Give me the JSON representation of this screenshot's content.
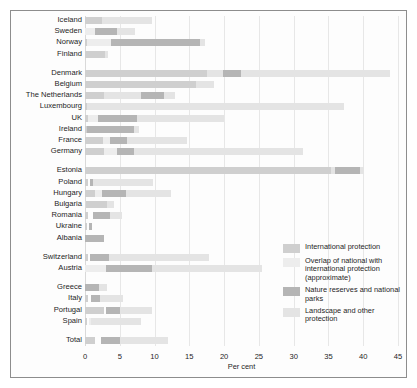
{
  "chart": {
    "type": "bar",
    "orientation": "horizontal",
    "stacked": true,
    "title": "",
    "xlabel": "Per cent",
    "ylabel": "",
    "xlim": [
      0,
      45
    ],
    "xticks": [
      0,
      5,
      10,
      15,
      20,
      25,
      30,
      35,
      40,
      45
    ],
    "grid": "vertical",
    "legend_position": "lower-right"
  },
  "chart_data": {
    "type": "bar",
    "orientation": "horizontal",
    "stacked": true,
    "title": "",
    "xlabel": "Per cent",
    "ylabel": "",
    "xlim": [
      0,
      45
    ],
    "xticks": [
      0,
      5,
      10,
      15,
      20,
      25,
      30,
      35,
      40,
      45
    ],
    "grid": "vertical",
    "legend_position": "lower-right",
    "series": [
      {
        "name": "International protection",
        "key": "intl",
        "color": "#cfcfcf"
      },
      {
        "name": "Overlap of national with international protection (approximate)",
        "key": "overlap",
        "color": "#ededed"
      },
      {
        "name": "Nature reserves and national parks",
        "key": "nature",
        "color": "#b5b5b5"
      },
      {
        "name": "Landscape and other protection",
        "key": "landscape",
        "color": "#e4e4e4"
      }
    ],
    "groups": [
      {
        "name": "Nordic",
        "categories": [
          "Iceland",
          "Sweden",
          "Norway",
          "Finland"
        ],
        "rows": [
          {
            "category": "Iceland",
            "segments": [
              {
                "key": "intl",
                "start": 0.0,
                "end": 2.5
              },
              {
                "key": "landscape",
                "start": 2.5,
                "end": 9.6
              }
            ]
          },
          {
            "category": "Sweden",
            "segments": [
              {
                "key": "overlap",
                "start": 0.0,
                "end": 1.4
              },
              {
                "key": "nature",
                "start": 1.4,
                "end": 4.6
              },
              {
                "key": "landscape",
                "start": 4.6,
                "end": 7.2
              }
            ]
          },
          {
            "category": "Norway",
            "segments": [
              {
                "key": "intl",
                "start": 0.0,
                "end": 0.3
              },
              {
                "key": "overlap",
                "start": 0.3,
                "end": 3.8
              },
              {
                "key": "nature",
                "start": 3.8,
                "end": 16.5
              },
              {
                "key": "landscape",
                "start": 16.5,
                "end": 17.3
              }
            ]
          },
          {
            "category": "Finland",
            "segments": [
              {
                "key": "intl",
                "start": 0.0,
                "end": 2.9
              },
              {
                "key": "landscape",
                "start": 2.9,
                "end": 3.3
              }
            ]
          }
        ]
      },
      {
        "name": "Western Europe",
        "categories": [
          "Denmark",
          "Belgium",
          "The Netherlands",
          "Luxembourg",
          "UK",
          "Ireland",
          "France",
          "Germany"
        ],
        "rows": [
          {
            "category": "Denmark",
            "segments": [
              {
                "key": "intl",
                "start": 0.0,
                "end": 17.5
              },
              {
                "key": "landscape",
                "start": 17.5,
                "end": 19.8
              },
              {
                "key": "nature",
                "start": 19.8,
                "end": 22.4
              },
              {
                "key": "landscape",
                "start": 22.4,
                "end": 43.9
              }
            ]
          },
          {
            "category": "Belgium",
            "segments": [
              {
                "key": "intl",
                "start": 0.0,
                "end": 16.0
              },
              {
                "key": "landscape",
                "start": 16.0,
                "end": 18.6
              }
            ]
          },
          {
            "category": "The Netherlands",
            "segments": [
              {
                "key": "intl",
                "start": 0.0,
                "end": 2.8
              },
              {
                "key": "landscape",
                "start": 2.8,
                "end": 8.0
              },
              {
                "key": "nature",
                "start": 8.0,
                "end": 11.3
              },
              {
                "key": "landscape",
                "start": 11.3,
                "end": 13.0
              }
            ]
          },
          {
            "category": "Luxembourg",
            "segments": [
              {
                "key": "intl",
                "start": 0.0,
                "end": 0.3
              },
              {
                "key": "landscape",
                "start": 0.3,
                "end": 37.2
              }
            ]
          },
          {
            "category": "UK",
            "segments": [
              {
                "key": "intl",
                "start": 0.0,
                "end": 0.4
              },
              {
                "key": "overlap",
                "start": 0.4,
                "end": 1.8
              },
              {
                "key": "nature",
                "start": 1.8,
                "end": 7.5
              },
              {
                "key": "landscape",
                "start": 7.5,
                "end": 20.0
              }
            ]
          },
          {
            "category": "Ireland",
            "segments": [
              {
                "key": "intl",
                "start": 0.0,
                "end": 0.3
              },
              {
                "key": "nature",
                "start": 0.3,
                "end": 7.1
              },
              {
                "key": "landscape",
                "start": 7.1,
                "end": 7.8
              }
            ]
          },
          {
            "category": "France",
            "segments": [
              {
                "key": "intl",
                "start": 0.0,
                "end": 2.6
              },
              {
                "key": "overlap",
                "start": 2.6,
                "end": 3.6
              },
              {
                "key": "nature",
                "start": 3.6,
                "end": 6.1
              },
              {
                "key": "landscape",
                "start": 6.1,
                "end": 14.7
              }
            ]
          },
          {
            "category": "Germany",
            "segments": [
              {
                "key": "intl",
                "start": 0.0,
                "end": 2.7
              },
              {
                "key": "overlap",
                "start": 2.7,
                "end": 4.6
              },
              {
                "key": "nature",
                "start": 4.6,
                "end": 7.0
              },
              {
                "key": "landscape",
                "start": 7.0,
                "end": 31.4
              }
            ]
          }
        ]
      },
      {
        "name": "Central and Eastern Europe",
        "categories": [
          "Estonia",
          "Poland",
          "Hungary",
          "Bulgaria",
          "Romania",
          "Ukraine",
          "Albania"
        ],
        "rows": [
          {
            "category": "Estonia",
            "segments": [
              {
                "key": "intl",
                "start": 0.0,
                "end": 35.4
              },
              {
                "key": "landscape",
                "start": 35.4,
                "end": 36.0
              },
              {
                "key": "nature",
                "start": 36.0,
                "end": 39.6
              },
              {
                "key": "landscape",
                "start": 39.6,
                "end": 40.1
              }
            ]
          },
          {
            "category": "Poland",
            "segments": [
              {
                "key": "intl",
                "start": 0.0,
                "end": 0.4
              },
              {
                "key": "nature",
                "start": 0.7,
                "end": 1.1
              },
              {
                "key": "landscape",
                "start": 1.1,
                "end": 9.8
              }
            ]
          },
          {
            "category": "Hungary",
            "segments": [
              {
                "key": "intl",
                "start": 0.0,
                "end": 1.5
              },
              {
                "key": "overlap",
                "start": 1.5,
                "end": 2.4
              },
              {
                "key": "nature",
                "start": 2.4,
                "end": 5.9
              },
              {
                "key": "landscape",
                "start": 5.9,
                "end": 12.3
              }
            ]
          },
          {
            "category": "Bulgaria",
            "segments": [
              {
                "key": "intl",
                "start": 0.2,
                "end": 3.2
              },
              {
                "key": "landscape",
                "start": 3.2,
                "end": 4.1
              }
            ]
          },
          {
            "category": "Romania",
            "segments": [
              {
                "key": "intl",
                "start": 0.0,
                "end": 0.4
              },
              {
                "key": "nature",
                "start": 1.1,
                "end": 3.6
              },
              {
                "key": "landscape",
                "start": 3.6,
                "end": 5.3
              }
            ]
          },
          {
            "category": "Ukraine",
            "segments": [
              {
                "key": "intl",
                "start": 0.0,
                "end": 0.3
              },
              {
                "key": "nature",
                "start": 0.6,
                "end": 1.0
              }
            ]
          },
          {
            "category": "Albania",
            "segments": [
              {
                "key": "nature",
                "start": 0.0,
                "end": 2.7
              }
            ]
          }
        ]
      },
      {
        "name": "Alpine",
        "categories": [
          "Switzerland",
          "Austria"
        ],
        "rows": [
          {
            "category": "Switzerland",
            "segments": [
              {
                "key": "intl",
                "start": 0.0,
                "end": 0.4
              },
              {
                "key": "nature",
                "start": 0.7,
                "end": 3.4
              },
              {
                "key": "landscape",
                "start": 3.4,
                "end": 17.8
              }
            ]
          },
          {
            "category": "Austria",
            "segments": [
              {
                "key": "overlap",
                "start": 0.0,
                "end": 3.0
              },
              {
                "key": "nature",
                "start": 3.0,
                "end": 9.6
              },
              {
                "key": "landscape",
                "start": 9.6,
                "end": 25.5
              }
            ]
          }
        ]
      },
      {
        "name": "Southern Europe",
        "categories": [
          "Greece",
          "Italy",
          "Portugal",
          "Spain"
        ],
        "rows": [
          {
            "category": "Greece",
            "segments": [
              {
                "key": "nature",
                "start": 0.0,
                "end": 2.0
              },
              {
                "key": "landscape",
                "start": 2.0,
                "end": 3.1
              }
            ]
          },
          {
            "category": "Italy",
            "segments": [
              {
                "key": "intl",
                "start": 0.0,
                "end": 0.4
              },
              {
                "key": "nature",
                "start": 0.9,
                "end": 2.2
              },
              {
                "key": "landscape",
                "start": 2.2,
                "end": 5.4
              }
            ]
          },
          {
            "category": "Portugal",
            "segments": [
              {
                "key": "intl",
                "start": 0.0,
                "end": 2.7
              },
              {
                "key": "nature",
                "start": 3.0,
                "end": 5.0
              },
              {
                "key": "landscape",
                "start": 5.0,
                "end": 9.6
              }
            ]
          },
          {
            "category": "Spain",
            "segments": [
              {
                "key": "intl",
                "start": 0.0,
                "end": 0.3
              },
              {
                "key": "overlap",
                "start": 0.6,
                "end": 0.9
              },
              {
                "key": "landscape",
                "start": 0.9,
                "end": 8.1
              }
            ]
          }
        ]
      },
      {
        "name": "Total",
        "categories": [
          "Total"
        ],
        "rows": [
          {
            "category": "Total",
            "segments": [
              {
                "key": "intl",
                "start": 0.0,
                "end": 1.5
              },
              {
                "key": "nature",
                "start": 2.3,
                "end": 5.0
              },
              {
                "key": "landscape",
                "start": 5.0,
                "end": 12.0
              }
            ]
          }
        ]
      }
    ]
  },
  "legend": {
    "items": [
      {
        "label": "International protection",
        "key": "intl",
        "swatch": true
      },
      {
        "label": "Overlap of national with international protection (approximate)",
        "key": "overlap",
        "swatch": true
      },
      {
        "label": "Nature reserves and national parks",
        "key": "nature",
        "swatch": true
      },
      {
        "label": "Landscape and other protection",
        "key": "landscape",
        "swatch": true
      }
    ]
  },
  "colors": {
    "intl": "#cfcfcf",
    "overlap": "#ededed",
    "nature": "#b5b5b5",
    "landscape": "#e4e4e4",
    "grid": "#e7e7e7",
    "frame": "#8d8d8d",
    "text": "#1d1d1d"
  }
}
